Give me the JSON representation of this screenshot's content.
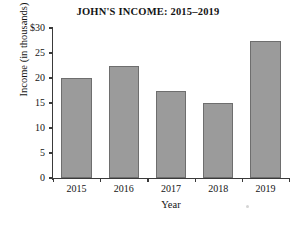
{
  "chart_data": {
    "type": "bar",
    "title": "JOHN'S INCOME: 2015–2019",
    "xlabel": "Year",
    "ylabel": "Income  (in thousands)",
    "categories": [
      "2015",
      "2016",
      "2017",
      "2018",
      "2019"
    ],
    "values": [
      20,
      22.5,
      17.5,
      15,
      27.5
    ],
    "series": [
      {
        "name": "Income",
        "values": [
          20,
          22.5,
          17.5,
          15,
          27.5
        ]
      }
    ],
    "ylim": [
      0,
      30
    ],
    "xlim": [
      0,
      5
    ],
    "y_ticks": [
      0,
      5,
      10,
      15,
      20,
      25,
      30
    ],
    "y_tick_labels": [
      "0",
      "5",
      "10",
      "15",
      "20",
      "25",
      "$30"
    ],
    "x_tick_labels": [
      "2015",
      "2016",
      "2017",
      "2018",
      "2019"
    ],
    "grid": false,
    "legend": false,
    "legend_position": "none",
    "bar_color": "#9b9b9b",
    "bar_edge_color": "#6e6e6e",
    "axis_color": "#3a3a3a",
    "background_color": "#ffffff",
    "text_color": "#141414"
  }
}
